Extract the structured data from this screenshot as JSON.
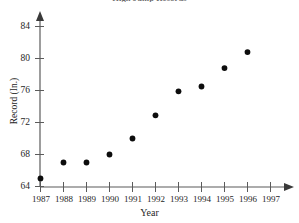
{
  "chart_data": {
    "type": "scatter",
    "title": "High Jump Records",
    "xlabel": "Year",
    "ylabel": "Record (In.)",
    "grid": false,
    "legend": "none",
    "xlim": [
      1987,
      1997
    ],
    "ylim": [
      64,
      85
    ],
    "xticks": [
      "1987",
      "1988",
      "1989",
      "1990",
      "1991",
      "1992",
      "1993",
      "1994",
      "1995",
      "1996",
      "1997"
    ],
    "yticks": [
      "64",
      "68",
      "72",
      "76",
      "80",
      "84"
    ],
    "x": [
      1987,
      1988,
      1989,
      1990,
      1991,
      1992,
      1993,
      1994,
      1995,
      1996
    ],
    "y": [
      65.0,
      67.0,
      67.0,
      68.0,
      70.0,
      72.9,
      75.9,
      76.5,
      78.8,
      80.8
    ],
    "points": [
      {
        "year": "1987",
        "record": 65.0
      },
      {
        "year": "1988",
        "record": 67.0
      },
      {
        "year": "1989",
        "record": 67.0
      },
      {
        "year": "1990",
        "record": 68.0
      },
      {
        "year": "1991",
        "record": 70.0
      },
      {
        "year": "1992",
        "record": 72.9
      },
      {
        "year": "1993",
        "record": 75.9
      },
      {
        "year": "1994",
        "record": 76.5
      },
      {
        "year": "1995",
        "record": 78.8
      },
      {
        "year": "1996",
        "record": 80.8
      }
    ],
    "marker": "filled-circle",
    "marker_color": "#0d0d0d",
    "axis_color": "#5b5b5b"
  },
  "axes": {
    "x_title": "Year",
    "y_title": "Record (In.)"
  }
}
